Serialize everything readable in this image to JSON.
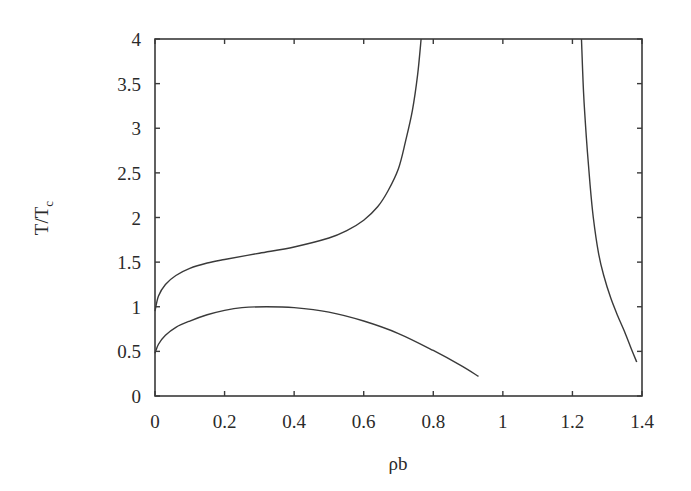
{
  "chart_data": {
    "type": "line",
    "title": "",
    "xlabel": "ρb",
    "ylabel": "T/T",
    "ylabel_subscript": "c",
    "xlim": [
      0,
      1.4
    ],
    "ylim": [
      0,
      4
    ],
    "grid": false,
    "legend": null,
    "x_ticks": [
      "0",
      "0.2",
      "0.4",
      "0.6",
      "0.8",
      "1",
      "1.2",
      "1.4"
    ],
    "y_ticks": [
      "0",
      "0.5",
      "1",
      "1.5",
      "2",
      "2.5",
      "3",
      "3.5",
      "4"
    ],
    "series": [
      {
        "name": "upper-left-branch",
        "x": [
          0.0,
          0.01,
          0.03,
          0.06,
          0.1,
          0.15,
          0.2,
          0.3,
          0.4,
          0.5,
          0.55,
          0.6,
          0.64,
          0.67,
          0.7,
          0.72,
          0.74,
          0.755,
          0.765
        ],
        "y": [
          0.95,
          1.12,
          1.25,
          1.35,
          1.43,
          1.49,
          1.53,
          1.6,
          1.67,
          1.77,
          1.85,
          1.97,
          2.12,
          2.3,
          2.55,
          2.85,
          3.2,
          3.6,
          4.0
        ]
      },
      {
        "name": "lower-branch",
        "x": [
          0.0,
          0.01,
          0.03,
          0.06,
          0.1,
          0.15,
          0.2,
          0.25,
          0.32,
          0.4,
          0.5,
          0.6,
          0.7,
          0.8,
          0.88,
          0.93
        ],
        "y": [
          0.48,
          0.58,
          0.68,
          0.77,
          0.84,
          0.91,
          0.96,
          0.99,
          1.0,
          0.99,
          0.94,
          0.84,
          0.7,
          0.51,
          0.34,
          0.22
        ]
      },
      {
        "name": "right-branch",
        "x": [
          1.226,
          1.232,
          1.24,
          1.25,
          1.26,
          1.275,
          1.29,
          1.31,
          1.33,
          1.35,
          1.37,
          1.385
        ],
        "y": [
          4.0,
          3.4,
          2.9,
          2.4,
          2.0,
          1.6,
          1.35,
          1.1,
          0.9,
          0.72,
          0.52,
          0.38
        ]
      }
    ]
  }
}
